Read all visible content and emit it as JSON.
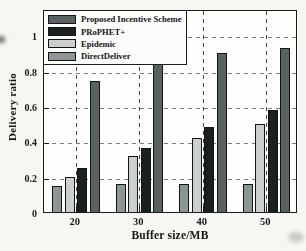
{
  "chart_data": {
    "type": "bar",
    "title": "",
    "xlabel": "Buffer size/MB",
    "ylabel": "Delivery ratio",
    "categories": [
      "20",
      "30",
      "40",
      "50"
    ],
    "series": [
      {
        "name": "Proposed Incentive Scheme",
        "color": "#596263",
        "values": [
          0.74,
          0.84,
          0.9,
          0.93
        ]
      },
      {
        "name": "PRoPHET+",
        "color": "#1b2121",
        "values": [
          0.25,
          0.36,
          0.48,
          0.58
        ]
      },
      {
        "name": "Epidemic",
        "color": "#cbcfce",
        "values": [
          0.2,
          0.32,
          0.42,
          0.5
        ]
      },
      {
        "name": "DirectDeliver",
        "color": "#8c9695",
        "values": [
          0.15,
          0.16,
          0.16,
          0.16
        ]
      }
    ],
    "ylim": [
      0,
      1.15
    ],
    "yticks": [
      0,
      0.2,
      0.4,
      0.6,
      0.8,
      1
    ],
    "ytick_labels": [
      "0",
      "0.2",
      "0.4",
      "0.6",
      "0.8",
      "1"
    ],
    "grid": "dashed-horizontal-and-vertical",
    "legend_position": "top-left",
    "axis_color": "#1c1c1c"
  }
}
